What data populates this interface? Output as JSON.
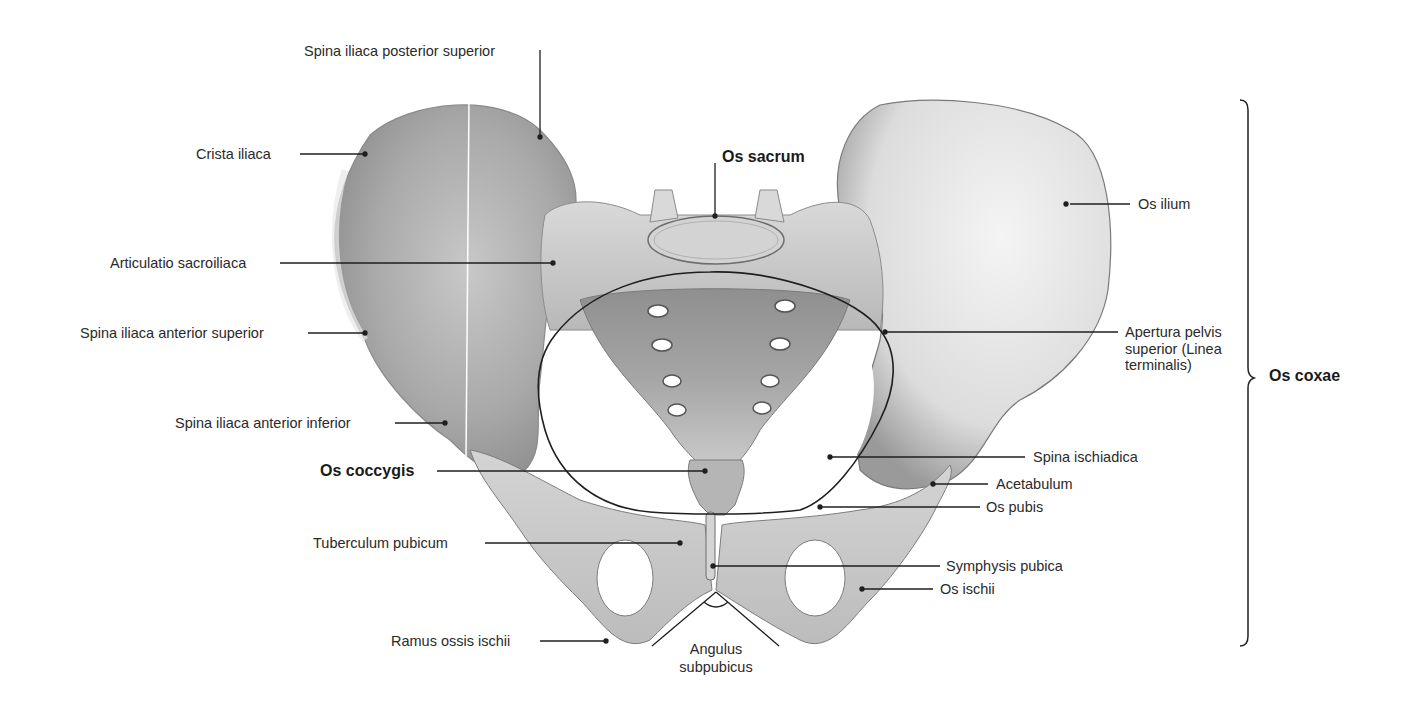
{
  "figure": {
    "group_label": "Os coxae",
    "colors": {
      "background": "#ffffff",
      "bone_light": "#e6e6e6",
      "bone_mid": "#bdbdbd",
      "bone_dark": "#7d7d7d",
      "line": "#1e1e1e"
    }
  },
  "labels": {
    "spina_iliaca_posterior_superior": "Spina iliaca posterior superior",
    "crista_iliaca": "Crista iliaca",
    "os_sacrum": "Os sacrum",
    "os_ilium": "Os ilium",
    "articulatio_sacroiliaca": "Articulatio sacroiliaca",
    "spina_iliaca_anterior_superior": "Spina iliaca anterior superior",
    "apertura_pelvis_superior": "Apertura pelvis\nsuperior (Linea\nterminalis)",
    "os_coxae": "Os coxae",
    "spina_iliaca_anterior_inferior": "Spina iliaca anterior inferior",
    "spina_ischiadica": "Spina ischiadica",
    "os_coccygis": "Os coccygis",
    "acetabulum": "Acetabulum",
    "os_pubis": "Os pubis",
    "tuberculum_pubicum": "Tuberculum pubicum",
    "symphysis_pubica": "Symphysis pubica",
    "os_ischii": "Os ischii",
    "ramus_ossis_ischii": "Ramus ossis ischii",
    "angulus_subpubicus": "Angulus\nsubpubicus"
  }
}
